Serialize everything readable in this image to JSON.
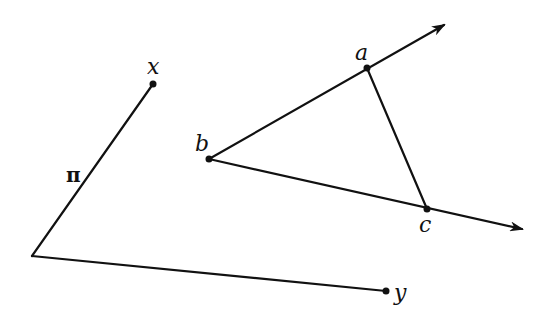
{
  "diagram": {
    "labels": {
      "x": "x",
      "y": "y",
      "pi": "π",
      "a": "a",
      "b": "b",
      "c": "c"
    },
    "points": {
      "x": [
        153,
        84
      ],
      "pi_vertex": [
        32,
        256
      ],
      "y": [
        386,
        291
      ],
      "a": [
        367,
        68
      ],
      "b": [
        209,
        159
      ],
      "c": [
        427,
        209
      ],
      "ray_ba_tip": [
        446,
        24
      ],
      "ray_bc_tip": [
        524,
        229
      ]
    },
    "segments": [
      {
        "from": "pi_vertex",
        "to": "x",
        "name": "path-pi-to-x"
      },
      {
        "from": "pi_vertex",
        "to": "y",
        "name": "path-pi-to-y"
      },
      {
        "from": "a",
        "to": "c",
        "name": "segment-ac"
      }
    ],
    "rays": [
      {
        "from": "b",
        "through": "a",
        "name": "ray-ba"
      },
      {
        "from": "b",
        "through": "c",
        "name": "ray-bc"
      }
    ],
    "colors": {
      "ink": "#111111",
      "background": "#ffffff"
    }
  }
}
